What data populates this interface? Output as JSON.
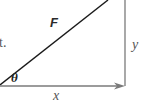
{
  "diagram": {
    "type": "vector-components-right-triangle",
    "text_fragment": "t.",
    "labels": {
      "hypotenuse": "F",
      "vertical": "y",
      "horizontal": "x",
      "angle": "θ"
    },
    "colors": {
      "hypotenuse": "#1a1a1a",
      "components": "#7a7a7a",
      "background": "#ffffff"
    }
  }
}
